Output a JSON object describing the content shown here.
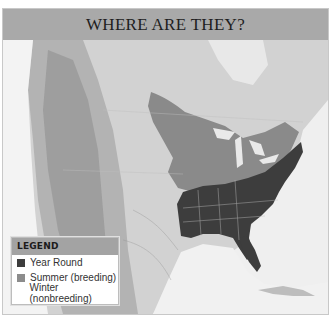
{
  "title": "WHERE ARE THEY?",
  "legend": {
    "heading": "LEGEND",
    "items": [
      {
        "label": "Year Round",
        "color": "#3d3d3d"
      },
      {
        "label": "Summer (breeding)",
        "color": "#8c8c8c"
      },
      {
        "label": "Winter (nonbreeding)",
        "color": ""
      }
    ]
  },
  "map": {
    "region": "North America (United States, southern Canada, Gulf of Mexico)",
    "colors": {
      "year_round": "#3d3d3d",
      "summer": "#8a8a8a",
      "land": "#cfcfcf",
      "water": "#f2f2f2",
      "title_bar": "#a9a9a9"
    }
  }
}
